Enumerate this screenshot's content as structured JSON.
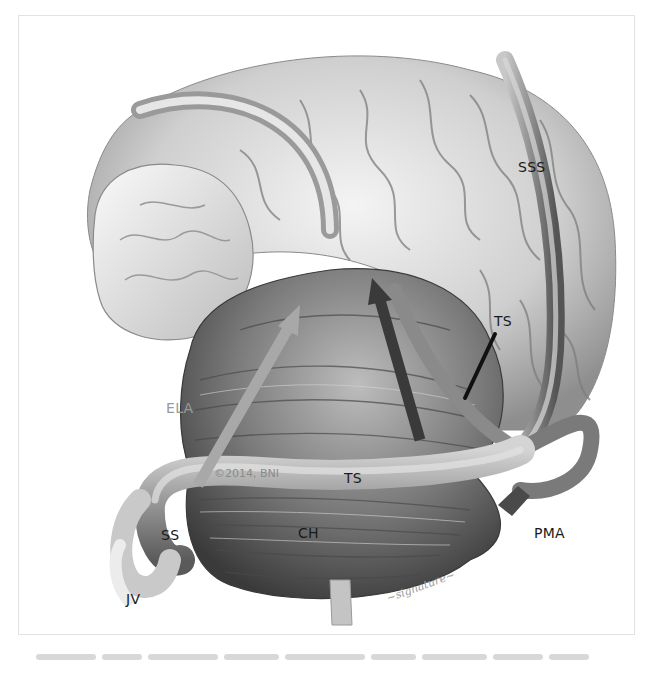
{
  "figure": {
    "labels": {
      "sss": "SSS",
      "ts_upper": "TS",
      "ts_lower": "TS",
      "ela": "ELA",
      "pma": "PMA",
      "ch": "CH",
      "ss": "SS",
      "jv": "JV"
    },
    "copyright": "©2014, BNI",
    "colors": {
      "ela_arrow": "#a8a8a8",
      "pma_arrow": "#4a4a4a",
      "ts_pointer": "#111111",
      "label_text": "#1a1a1a",
      "frame_border": "#e2e2e2"
    }
  },
  "caption": {
    "visible": "blurred caption text"
  }
}
